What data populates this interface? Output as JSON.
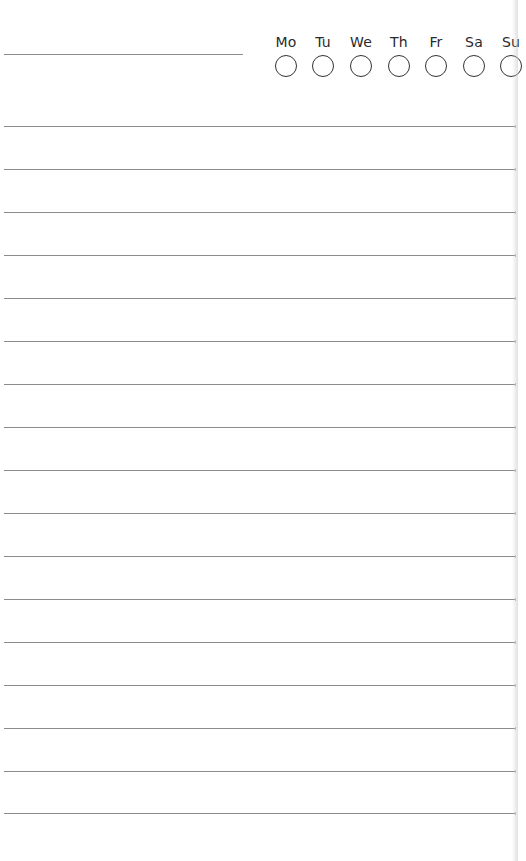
{
  "page": {
    "background": "#ffffff",
    "line_color": "#8c8c8c",
    "text_color": "#2a2a2a"
  },
  "header": {
    "title_line": {
      "left": 4,
      "top": 54,
      "width": 239
    },
    "days": [
      {
        "label": "Mo",
        "center_x": 286
      },
      {
        "label": "Tu",
        "center_x": 323
      },
      {
        "label": "We",
        "center_x": 361
      },
      {
        "label": "Th",
        "center_x": 399
      },
      {
        "label": "Fr",
        "center_x": 436
      },
      {
        "label": "Sa",
        "center_x": 474
      },
      {
        "label": "Su",
        "center_x": 511
      }
    ]
  },
  "ruled_lines": {
    "count": 17,
    "positions_y": [
      126,
      169,
      212,
      255,
      298,
      341,
      384,
      427,
      470,
      513,
      556,
      599,
      642,
      685,
      728,
      771,
      813
    ]
  }
}
